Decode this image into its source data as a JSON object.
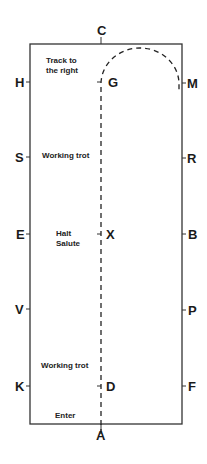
{
  "arena": {
    "border_color": "#333333",
    "path_color": "#222222",
    "letters": {
      "top": "C",
      "bottom": "A",
      "left": [
        "H",
        "S",
        "E",
        "V",
        "K"
      ],
      "right": [
        "M",
        "R",
        "B",
        "P",
        "F"
      ],
      "centre": [
        "G",
        "X",
        "D"
      ]
    }
  },
  "instructions": [
    {
      "text": "Track to\nthe right",
      "at": "C/H corner"
    },
    {
      "text": "Working trot",
      "at": "S"
    },
    {
      "text": "Halt\nSalute",
      "at": "X"
    },
    {
      "text": "Working trot",
      "at": "K"
    },
    {
      "text": "Enter",
      "at": "A"
    }
  ]
}
